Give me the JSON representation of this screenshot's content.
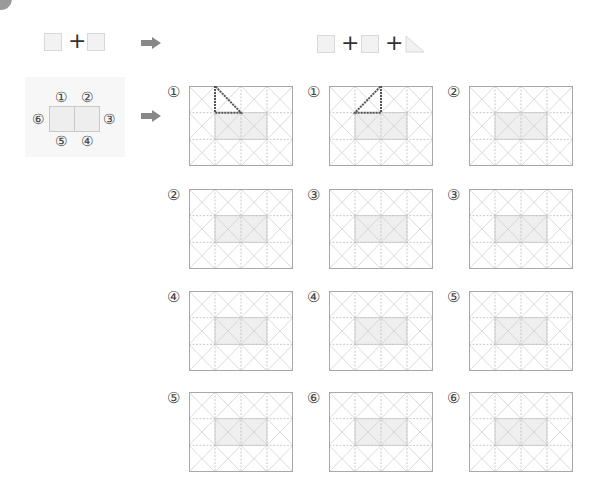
{
  "header": {
    "left_formula": {
      "shapes": [
        "square",
        "square"
      ],
      "operator": "+"
    },
    "right_formula": {
      "shapes": [
        "square",
        "square",
        "triangle"
      ],
      "operator": "+"
    },
    "arrow_icon": "right-arrow-icon"
  },
  "net": {
    "labels": {
      "top_left": "①",
      "top_right": "②",
      "right": "③",
      "bottom_right": "④",
      "bottom_left": "⑤",
      "left": "⑥"
    }
  },
  "grid": {
    "cols": 4,
    "rows": 3,
    "shaded_cells": [
      [
        1,
        1
      ],
      [
        1,
        2
      ]
    ]
  },
  "colors": {
    "grid_line": "#c4c4c4",
    "shade": "#efefef",
    "triangle": "#555555",
    "arrow": "#888888"
  },
  "panels": [
    {
      "label": "①",
      "triangle": "top-left-down"
    },
    {
      "label": "①",
      "triangle": "top-right-up"
    },
    {
      "label": "②",
      "triangle": "none"
    },
    {
      "label": "②",
      "triangle": "none"
    },
    {
      "label": "③",
      "triangle": "none"
    },
    {
      "label": "③",
      "triangle": "none"
    },
    {
      "label": "④",
      "triangle": "none"
    },
    {
      "label": "④",
      "triangle": "none"
    },
    {
      "label": "⑤",
      "triangle": "none"
    },
    {
      "label": "⑤",
      "triangle": "none"
    },
    {
      "label": "⑥",
      "triangle": "none"
    },
    {
      "label": "⑥",
      "triangle": "none"
    }
  ]
}
